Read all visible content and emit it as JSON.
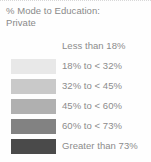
{
  "legend": {
    "title_line1": "% Mode to Education:",
    "title_line2": "Private",
    "text_color": "#8c8c8c",
    "background": "#fefefe"
  },
  "chart_data": {
    "type": "heatmap",
    "title": "% Mode to Education: Private",
    "subtitle": "Private",
    "xlabel": "",
    "ylabel": "",
    "legend_position": "standalone",
    "grid": false,
    "categories": [
      "Less than 18%",
      "18% to < 32%",
      "32% to < 45%",
      "45% to < 60%",
      "60% to < 73%",
      "Greater than 73%"
    ],
    "values": [
      18,
      32,
      45,
      60,
      73,
      100
    ],
    "bins": [
      {
        "label": "Less than 18%",
        "color": "#ffffff",
        "has_swatch": false,
        "min": 0,
        "max": 18
      },
      {
        "label": "18% to < 32%",
        "color": "#e8e8e8",
        "has_swatch": true,
        "min": 18,
        "max": 32
      },
      {
        "label": "32% to < 45%",
        "color": "#c9c9c9",
        "has_swatch": true,
        "min": 32,
        "max": 45
      },
      {
        "label": "45% to < 60%",
        "color": "#b0b0b0",
        "has_swatch": true,
        "min": 45,
        "max": 60
      },
      {
        "label": "60% to < 73%",
        "color": "#828282",
        "has_swatch": true,
        "min": 60,
        "max": 73
      },
      {
        "label": "Greater than 73%",
        "color": "#4a4a4a",
        "has_swatch": true,
        "min": 73,
        "max": 100
      }
    ]
  }
}
